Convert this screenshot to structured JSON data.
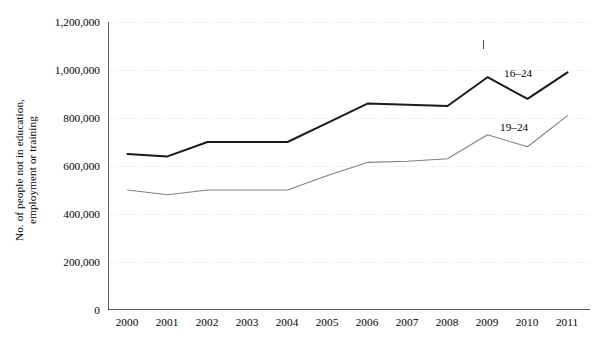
{
  "chart_data": {
    "type": "line",
    "title": "",
    "xlabel": "",
    "ylabel": "No. of people not in education,\nemployment or training",
    "x": [
      2000,
      2001,
      2002,
      2003,
      2004,
      2005,
      2006,
      2007,
      2008,
      2009,
      2010,
      2011
    ],
    "categories": [
      "2000",
      "2001",
      "2002",
      "2003",
      "2004",
      "2005",
      "2006",
      "2007",
      "2008",
      "2009",
      "2010",
      "2011"
    ],
    "series": [
      {
        "name": "16–24",
        "color": "#1a1a1a",
        "values": [
          650000,
          640000,
          700000,
          700000,
          700000,
          780000,
          860000,
          855000,
          850000,
          970000,
          880000,
          990000
        ]
      },
      {
        "name": "19–24",
        "color": "#808080",
        "values": [
          500000,
          480000,
          500000,
          500000,
          500000,
          560000,
          615000,
          620000,
          630000,
          730000,
          680000,
          810000
        ]
      }
    ],
    "ylim": [
      0,
      1200000
    ],
    "yticks": [
      0,
      200000,
      400000,
      600000,
      800000,
      1000000,
      1200000
    ],
    "ytick_labels": [
      "0",
      "200,000",
      "400,000",
      "600,000",
      "800,000",
      "1,000,000",
      "1,200,000"
    ],
    "grid": true,
    "grid_style": "dotted-horizontal",
    "legend_position": "inline-right-of-lines",
    "annotations": [
      {
        "name": "stray-tick-above-2009",
        "x": 2009,
        "text": ""
      }
    ]
  },
  "axis": {
    "y_axis_title_line1": "No. of people not in education,",
    "y_axis_title_line2": "employment or training"
  }
}
